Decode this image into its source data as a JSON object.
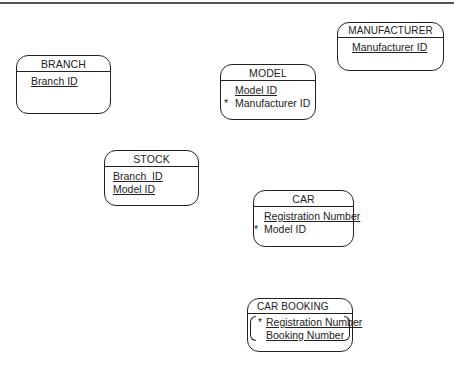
{
  "diagram": {
    "type": "entity-relationship",
    "entities": [
      {
        "name": "BRANCH",
        "attributes": [
          {
            "name": "Branch ID",
            "primary_key": true,
            "foreign_key": false
          }
        ]
      },
      {
        "name": "MANUFACTURER",
        "attributes": [
          {
            "name": "Manufacturer ID",
            "primary_key": true,
            "foreign_key": false
          }
        ]
      },
      {
        "name": "MODEL",
        "attributes": [
          {
            "name": "Model ID",
            "primary_key": true,
            "foreign_key": false
          },
          {
            "name": "Manufacturer ID",
            "primary_key": false,
            "foreign_key": true
          }
        ]
      },
      {
        "name": "STOCK",
        "attributes": [
          {
            "name": "Branch  ID",
            "primary_key": true,
            "foreign_key": false
          },
          {
            "name": "Model ID",
            "primary_key": true,
            "foreign_key": false
          }
        ]
      },
      {
        "name": "CAR",
        "attributes": [
          {
            "name": "Registration Number",
            "primary_key": true,
            "foreign_key": false
          },
          {
            "name": "Model ID",
            "primary_key": false,
            "foreign_key": true
          }
        ]
      },
      {
        "name": "CAR BOOKING",
        "attributes": [
          {
            "name": "Registration Number",
            "primary_key": true,
            "foreign_key": true
          },
          {
            "name": "Booking Number",
            "primary_key": true,
            "foreign_key": false
          }
        ]
      }
    ],
    "fk_marker": "*"
  }
}
